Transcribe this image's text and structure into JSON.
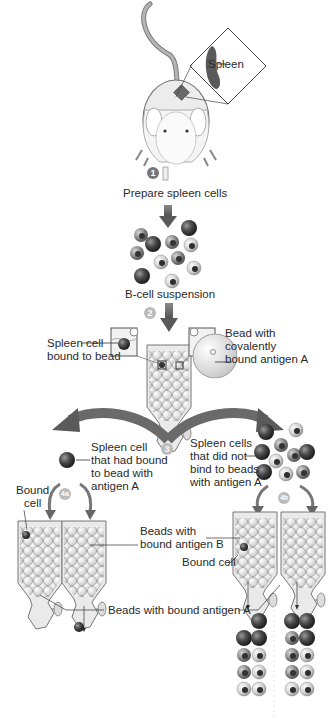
{
  "diagram": {
    "labels": {
      "spleen": "Spleen",
      "prepare": "Prepare spleen cells",
      "suspension": "B-cell suspension",
      "spleen_cell_bound_1": "Spleen cell",
      "spleen_cell_bound_2": "bound to bead",
      "bead_1": "Bead with",
      "bead_2": "covalently",
      "bead_3": "bound antigen A",
      "had_bound_1": "Spleen cell",
      "had_bound_2": "that had bound",
      "had_bound_3": "to bead with",
      "had_bound_4": "antigen A",
      "did_not_1": "Spleen cells",
      "did_not_2": "that did not",
      "did_not_3": "bind to beads",
      "did_not_4": "with antigen A",
      "bound_cell_left_1": "Bound",
      "bound_cell_left_2": "cell",
      "beads_b_1": "Beads with",
      "beads_b_2": "bound antigen B",
      "bound_cell_right": "Bound cell",
      "beads_a": "Beads with bound antigen A"
    },
    "steps": {
      "s1": "1",
      "s2": "2",
      "s3": "3",
      "s4a": "4a",
      "s4b": "4b"
    },
    "colors": {
      "arrow": "#6e6e6e",
      "cell_dark": "#3a3a3a",
      "cell_light": "#c9c9c9",
      "column": "#e8e8e8",
      "spleen": "#555555"
    }
  }
}
